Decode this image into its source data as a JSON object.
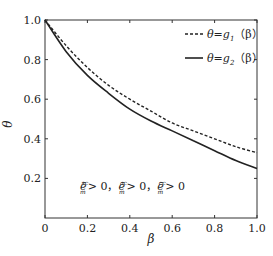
{
  "chart_data": {
    "type": "line",
    "title": "",
    "xlabel": "β",
    "ylabel": "θ",
    "xlim": [
      0,
      1.0
    ],
    "ylim": [
      0,
      1.0
    ],
    "grid": false,
    "legend_position": "upper right",
    "x_ticks": [
      "0",
      "0.2",
      "0.4",
      "0.6",
      "0.8",
      "1.0"
    ],
    "y_ticks": [
      "0.2",
      "0.4",
      "0.6",
      "0.8",
      "1.0"
    ],
    "x": [
      0,
      0.1,
      0.2,
      0.3,
      0.4,
      0.5,
      0.6,
      0.7,
      0.8,
      0.9,
      1.0
    ],
    "series": [
      {
        "name": "θ=g₁（β）",
        "style": "dashed",
        "color": "#222222",
        "values": [
          1.0,
          0.87,
          0.76,
          0.67,
          0.6,
          0.54,
          0.48,
          0.44,
          0.4,
          0.36,
          0.33
        ]
      },
      {
        "name": "θ=g₂（β）",
        "style": "solid",
        "color": "#222222",
        "values": [
          1.0,
          0.84,
          0.72,
          0.63,
          0.55,
          0.49,
          0.44,
          0.39,
          0.34,
          0.29,
          0.25
        ]
      }
    ],
    "annotations": [
      {
        "text": "ē_m^sc > 0，ē_m^ac > 0，ē_m^cc > 0",
        "x": 0.12,
        "y": 0.17
      }
    ]
  },
  "legend": {
    "items": [
      {
        "label_main": "θ=g",
        "sub": "1",
        "label_tail": "（β）"
      },
      {
        "label_main": "θ=g",
        "sub": "2",
        "label_tail": "（β）"
      }
    ]
  },
  "annotation": {
    "parts": [
      {
        "base": "ē",
        "sub": "m",
        "sup": "sc",
        "rel": "> 0，"
      },
      {
        "base": "ē",
        "sub": "m",
        "sup": "ac",
        "rel": "> 0，"
      },
      {
        "base": "ē",
        "sub": "m",
        "sup": "cc",
        "rel": "> 0"
      }
    ]
  }
}
